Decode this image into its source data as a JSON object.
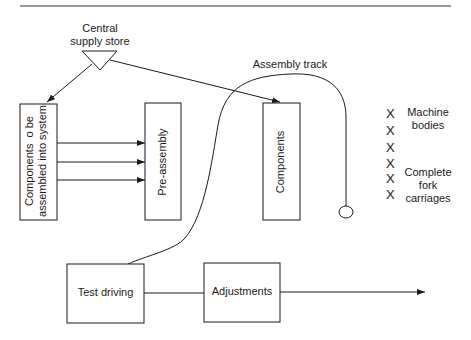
{
  "diagram": {
    "type": "process-flow",
    "nodes": {
      "central_supply_store": {
        "label_line1": "Central",
        "label_line2": "supply store",
        "shape": "triangle"
      },
      "components_to_assemble": {
        "label_line1": "Components  o be",
        "label_line2": "assembled into system",
        "shape": "rectangle"
      },
      "pre_assembly": {
        "label": "Pre-assembly",
        "shape": "rectangle"
      },
      "components": {
        "label": "Components",
        "shape": "rectangle"
      },
      "test_driving": {
        "label": "Test driving",
        "shape": "rectangle"
      },
      "adjustments": {
        "label": "Adjustments",
        "shape": "rectangle"
      }
    },
    "track": {
      "label": "Assembly track"
    },
    "side_legend": {
      "marker": "X",
      "markers": [
        "X",
        "X",
        "X",
        "X",
        "X",
        "X"
      ],
      "machine_bodies_line1": "Machine",
      "machine_bodies_line2": "bodies",
      "fork_line1": "Complete",
      "fork_line2": "fork",
      "fork_line3": "carriages"
    },
    "edges": [
      {
        "from": "central_supply_store",
        "to": "components_to_assemble"
      },
      {
        "from": "central_supply_store",
        "to": "components"
      },
      {
        "from": "components_to_assemble",
        "to": "pre_assembly",
        "count": 3
      },
      {
        "from": "test_driving",
        "to": "adjustments"
      },
      {
        "from": "adjustments",
        "to": "exit"
      }
    ],
    "colors": {
      "stroke": "#1a1a1a",
      "background": "#ffffff"
    }
  }
}
